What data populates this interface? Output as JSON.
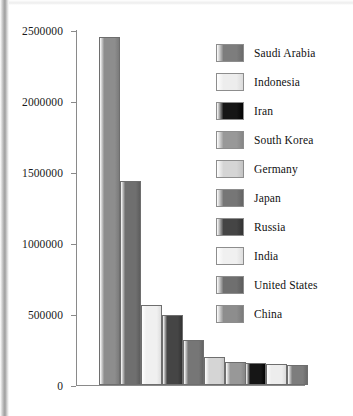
{
  "chart_data": {
    "type": "bar",
    "title": "",
    "subtitle": "",
    "xlabel": "",
    "ylabel": "",
    "categories": [
      "China",
      "United States",
      "India",
      "Russia",
      "Japan",
      "Germany",
      "South Korea",
      "Iran",
      "Indonesia",
      "Saudi Arabia"
    ],
    "values": [
      2450000,
      1440000,
      560000,
      490000,
      320000,
      195000,
      160000,
      155000,
      150000,
      140000
    ],
    "ylim": [
      0,
      2500000
    ],
    "yticks": [
      0,
      500000,
      1000000,
      1500000,
      2000000,
      2500000
    ],
    "ytick_labels": [
      "0",
      "500000",
      "1000000",
      "1500000",
      "2000000",
      "2500000"
    ],
    "xtick_labels": [],
    "grid": false,
    "legend_position": "upper-right",
    "legend": [
      {
        "label": "Saudi Arabia",
        "color": "#7d7d7d",
        "value": 140000
      },
      {
        "label": "Indonesia",
        "color": "#ededed",
        "value": 150000
      },
      {
        "label": "Iran",
        "color": "#161616",
        "value": 155000
      },
      {
        "label": "South Korea",
        "color": "#989898",
        "value": 160000
      },
      {
        "label": "Germany",
        "color": "#d5d5d5",
        "value": 195000
      },
      {
        "label": "Japan",
        "color": "#767676",
        "value": 320000
      },
      {
        "label": "Russia",
        "color": "#454545",
        "value": 490000
      },
      {
        "label": "India",
        "color": "#f0f0f0",
        "value": 560000
      },
      {
        "label": "United States",
        "color": "#6f6f6f",
        "value": 1440000
      },
      {
        "label": "China",
        "color": "#8d8d8d",
        "value": 2450000
      }
    ],
    "bars": [
      {
        "label": "China",
        "value": 2450000,
        "color": "#8d8d8d"
      },
      {
        "label": "United States",
        "value": 1440000,
        "color": "#6f6f6f"
      },
      {
        "label": "India",
        "value": 560000,
        "color": "#f0f0f0"
      },
      {
        "label": "Russia",
        "value": 490000,
        "color": "#454545"
      },
      {
        "label": "Japan",
        "value": 320000,
        "color": "#767676"
      },
      {
        "label": "Germany",
        "value": 195000,
        "color": "#d5d5d5"
      },
      {
        "label": "South Korea",
        "value": 160000,
        "color": "#989898"
      },
      {
        "label": "Iran",
        "value": 155000,
        "color": "#161616"
      },
      {
        "label": "Indonesia",
        "value": 150000,
        "color": "#ededed"
      },
      {
        "label": "Saudi Arabia",
        "value": 140000,
        "color": "#7d7d7d"
      }
    ]
  }
}
